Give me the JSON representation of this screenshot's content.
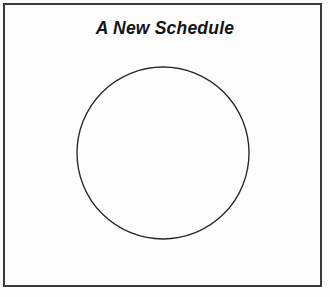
{
  "page": {
    "title": "A New Schedule",
    "background_color": "#fdfdfd",
    "frame": {
      "name": "page-border",
      "color": "#3a3a3a",
      "thickness_px": 2
    }
  },
  "shapes": [
    {
      "name": "blank-circle",
      "type": "circle",
      "center_x": 163,
      "center_y": 153,
      "radius": 86,
      "stroke_color": "#262626",
      "fill": "none",
      "label": ""
    }
  ]
}
